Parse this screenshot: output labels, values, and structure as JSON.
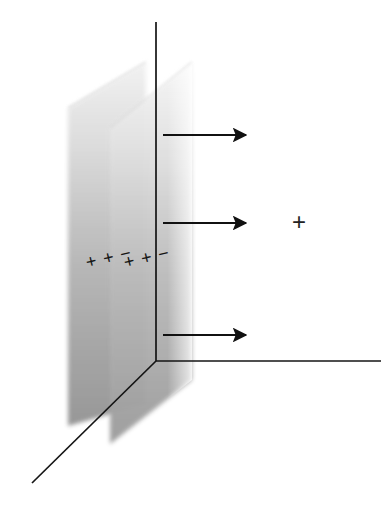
{
  "figure": {
    "title": "",
    "background_color": "#ffffff",
    "width": 392,
    "height": 507
  },
  "axes": {
    "line_color": "#141414",
    "vertical_axis": {
      "name": "vertical-axis",
      "x1": 156,
      "y1": 22,
      "x2": 156,
      "y2": 361
    },
    "horizontal_axis": {
      "name": "horizontal-axis",
      "x1": 156,
      "y1": 361,
      "x2": 381,
      "y2": 361
    },
    "depth_axis": {
      "name": "depth-axis",
      "x1": 156,
      "y1": 361,
      "x2": 32,
      "y2": 483
    }
  },
  "plates": [
    {
      "name": "capacitor-plate-left",
      "label": "left plate",
      "fill_top_color": "#e8e8e8",
      "fill_bottom_color": "#9a9a9a",
      "points": "68,108 146,62 146,404 68,426"
    },
    {
      "name": "capacitor-plate-right",
      "label": "right plate",
      "fill_top_color": "#ececec",
      "fill_bottom_color": "#a2a2a2",
      "points": "110,128 192,62 192,380 110,444"
    }
  ],
  "charge_markings": [
    {
      "name": "charges-plate-left",
      "text": "+ + −"
    },
    {
      "name": "charges-plate-right",
      "text": "+ + −"
    }
  ],
  "field_arrows": {
    "color": "#111111",
    "label": "electric field lines",
    "items": [
      {
        "name": "field-arrow-top",
        "x1": 163,
        "y": 135,
        "x2": 252
      },
      {
        "name": "field-arrow-middle",
        "x1": 163,
        "y": 223,
        "x2": 252
      },
      {
        "name": "field-arrow-bottom",
        "x1": 163,
        "y": 335,
        "x2": 252
      }
    ]
  },
  "test_charge": {
    "name": "test-charge-symbol",
    "symbol": "+",
    "x": 300,
    "y": 222,
    "color": "#222222"
  }
}
